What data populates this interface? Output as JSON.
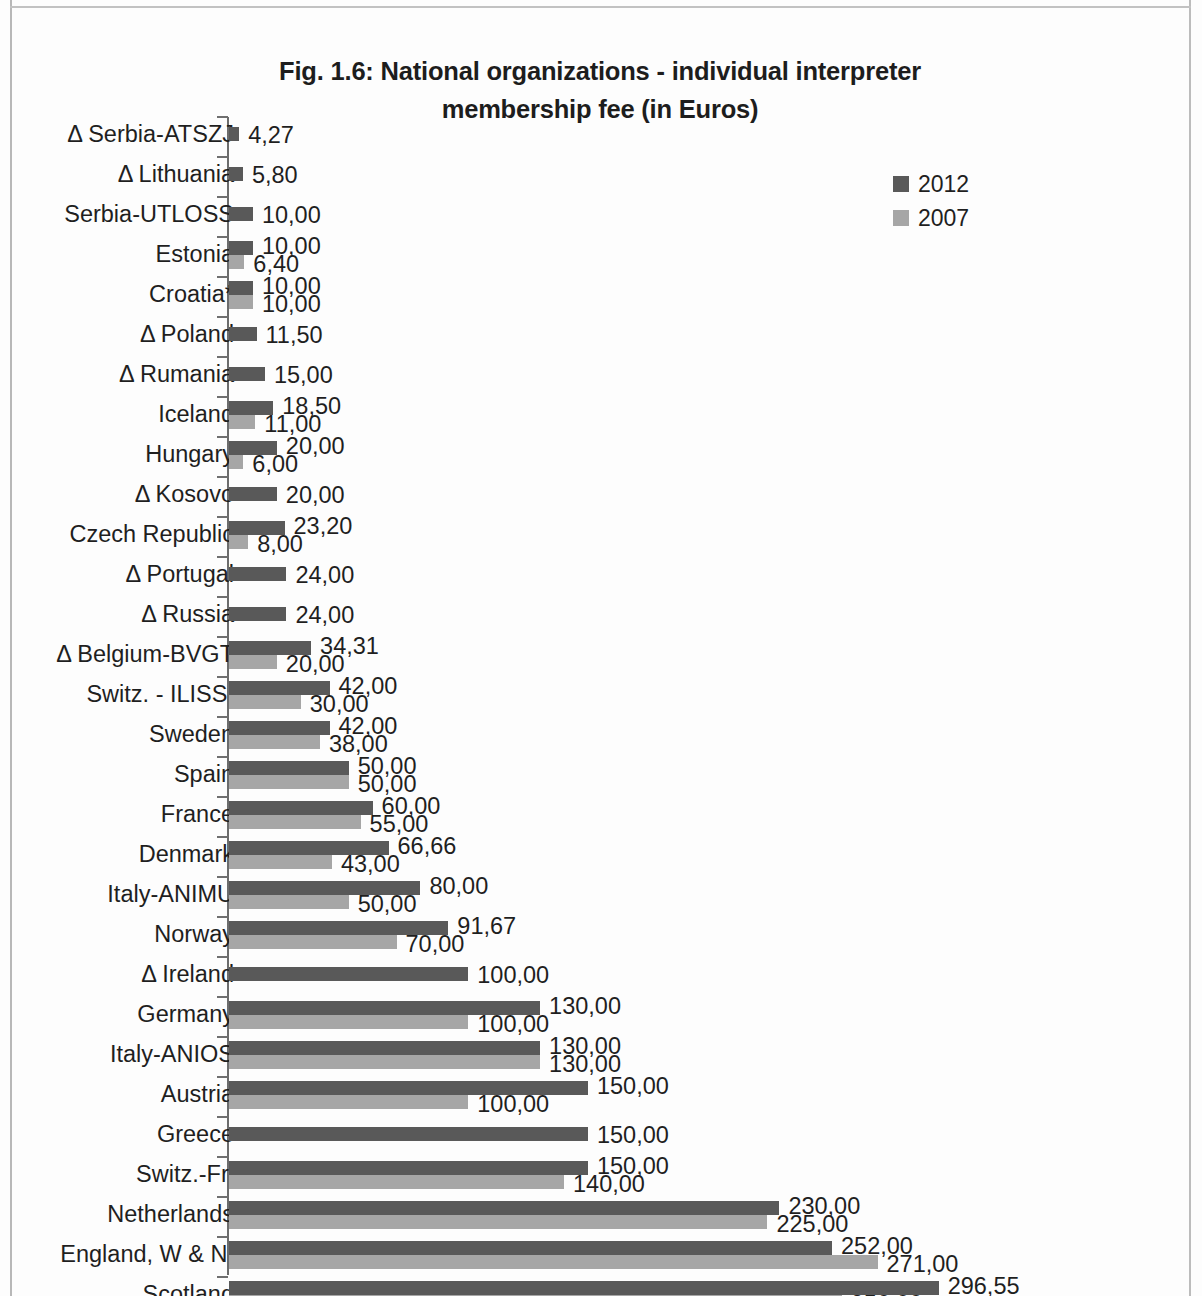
{
  "chart_data": {
    "type": "bar",
    "orientation": "horizontal",
    "title": "Fig. 1.6: National organizations - individual interpreter membership fee (in Euros)",
    "title_line1": "Fig. 1.6: National organizations - individual interpreter",
    "title_line2": "membership fee (in Euros)",
    "xlabel": "",
    "ylabel": "",
    "grid": false,
    "xlim": [
      0,
      312
    ],
    "legend_position": "top-right",
    "colors": {
      "series_2012": "#595959",
      "series_2007": "#a6a6a6"
    },
    "legend": [
      {
        "label": "2012",
        "color": "#595959"
      },
      {
        "label": "2007",
        "color": "#a6a6a6"
      }
    ],
    "categories": [
      "Δ Serbia-ATSZJ",
      "Δ Lithuania",
      "Serbia-UTLOSS",
      "Estonia",
      "Croatia*",
      "Δ Poland",
      "Δ Rumania",
      "Iceland",
      "Hungary",
      "Δ Kosovo",
      "Czech Republic",
      "Δ Portugal",
      "Δ Russia",
      "Δ Belgium-BVGT",
      "Switz. - ILISSI",
      "Sweden",
      "Spain",
      "France",
      "Denmark",
      "Italy-ANIMU",
      "Norway",
      "Δ Ireland",
      "Germany",
      "Italy-ANIOS",
      "Austria",
      "Greece",
      "Switz.-Fr.",
      "Netherlands",
      "England, W & NI",
      "Scotland",
      "Switz.-Ger."
    ],
    "series": [
      {
        "name": "2012",
        "color": "#595959",
        "values": [
          4.27,
          5.8,
          10.0,
          10.0,
          10.0,
          11.5,
          15.0,
          18.5,
          20.0,
          20.0,
          23.2,
          24.0,
          24.0,
          34.31,
          42.0,
          42.0,
          50.0,
          60.0,
          66.66,
          80.0,
          91.67,
          100.0,
          130.0,
          130.0,
          150.0,
          150.0,
          150.0,
          230.0,
          252.0,
          296.55,
          312.0
        ],
        "labels": [
          "4,27",
          "5,80",
          "10,00",
          "10,00",
          "10,00",
          "11,50",
          "15,00",
          "18,50",
          "20,00",
          "20,00",
          "23,20",
          "24,00",
          "24,00",
          "34,31",
          "42,00",
          "42,00",
          "50,00",
          "60,00",
          "66,66",
          "80,00",
          "91,67",
          "100,00",
          "130,00",
          "130,00",
          "150,00",
          "150,00",
          "150,00",
          "230,00",
          "252,00",
          "296,55",
          "312,00"
        ]
      },
      {
        "name": "2007",
        "color": "#a6a6a6",
        "values": [
          null,
          null,
          null,
          6.4,
          10.0,
          null,
          null,
          11.0,
          6.0,
          null,
          8.0,
          null,
          null,
          20.0,
          30.0,
          38.0,
          50.0,
          55.0,
          43.0,
          50.0,
          70.0,
          null,
          100.0,
          130.0,
          100.0,
          null,
          140.0,
          225.0,
          271.0,
          256.0,
          225.0
        ],
        "labels": [
          null,
          null,
          null,
          "6,40",
          "10,00",
          null,
          null,
          "11,00",
          "6,00",
          null,
          "8,00",
          null,
          null,
          "20,00",
          "30,00",
          "38,00",
          "50,00",
          "55,00",
          "43,00",
          "50,00",
          "70,00",
          null,
          "100,00",
          "130,00",
          "100,00",
          null,
          "140,00",
          "225,00",
          "271,00",
          "256,00",
          "225,00"
        ]
      }
    ]
  }
}
